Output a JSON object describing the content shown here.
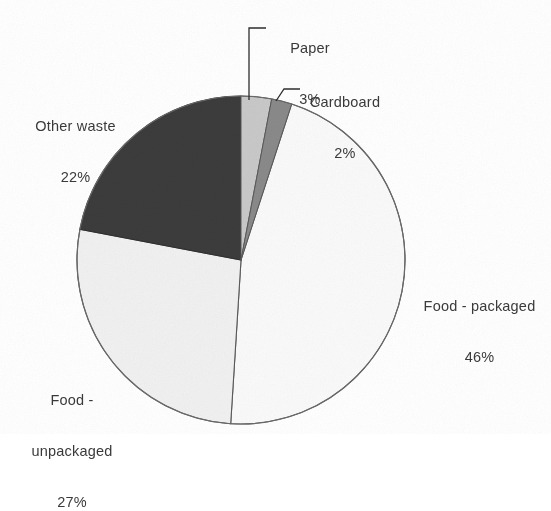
{
  "chart_data": {
    "type": "pie",
    "title": "",
    "subtitle": "",
    "xlabel": "",
    "ylabel": "",
    "legend_position": "none",
    "grid": false,
    "label_format": "name and percent",
    "start_angle_deg": 0,
    "direction": "clockwise",
    "categories": [
      "Paper",
      "Cardboard",
      "Food - packaged",
      "Food - unpackaged",
      "Other waste"
    ],
    "values": [
      3,
      2,
      46,
      27,
      22
    ],
    "value_labels": [
      "3%",
      "2%",
      "46%",
      "27%",
      "22%"
    ],
    "colors": [
      "#c9c9c9",
      "#8a8a8a",
      "#fafafa",
      "#f1f1f1",
      "#3c3c3c"
    ],
    "slices": [
      {
        "name": "Paper",
        "value": 3,
        "percent_label": "3%",
        "color": "#c9c9c9",
        "start_angle_deg": 0,
        "end_angle_deg": 10.8,
        "leader_line": true
      },
      {
        "name": "Cardboard",
        "value": 2,
        "percent_label": "2%",
        "color": "#8a8a8a",
        "start_angle_deg": 10.8,
        "end_angle_deg": 18.0,
        "leader_line": true
      },
      {
        "name": "Food - packaged",
        "value": 46,
        "percent_label": "46%",
        "color": "#fafafa",
        "start_angle_deg": 18.0,
        "end_angle_deg": 183.6,
        "leader_line": false
      },
      {
        "name": "Food - unpackaged",
        "value": 27,
        "percent_label": "27%",
        "color": "#f1f1f1",
        "start_angle_deg": 183.6,
        "end_angle_deg": 280.8,
        "leader_line": false
      },
      {
        "name": "Other waste",
        "value": 22,
        "percent_label": "22%",
        "color": "#3c3c3c",
        "start_angle_deg": 280.8,
        "end_angle_deg": 360.0,
        "leader_line": false
      }
    ]
  },
  "labels": {
    "paper": {
      "name": "Paper",
      "percent": "3%"
    },
    "cardboard": {
      "name": "Cardboard",
      "percent": "2%"
    },
    "food_packaged": {
      "name": "Food - packaged",
      "percent": "46%"
    },
    "food_unpackaged_1": {
      "name": "Food -"
    },
    "food_unpackaged_2": {
      "name": "unpackaged",
      "percent": "27%"
    },
    "other_waste": {
      "name": "Other waste",
      "percent": "22%"
    }
  },
  "style": {
    "background": "#ffffff",
    "outline_color": "#555555",
    "text_color": "#3a3a3a"
  }
}
